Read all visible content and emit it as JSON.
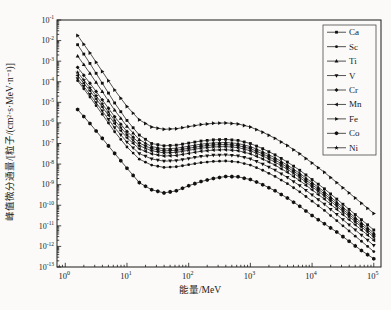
{
  "page": {
    "background": "#fbfaf8",
    "ink_color": "#1a1a1a"
  },
  "chart_data": {
    "type": "line",
    "title": "",
    "x_axis": {
      "label": "能量/MeV",
      "scale": "log",
      "tick_exponents": [
        0,
        1,
        2,
        3,
        4,
        5
      ],
      "range_log10": [
        -0.134,
        5.117
      ]
    },
    "y_axis": {
      "label": "峰值微分通量/[粒子/(cm²·s·MeV·n⁻¹)]",
      "scale": "log",
      "tick_exponents": [
        -1,
        -2,
        -3,
        -4,
        -5,
        -6,
        -7,
        -8,
        -9,
        -10,
        -11,
        -12,
        -13
      ],
      "range_log10": [
        -13.0,
        -1.0
      ]
    },
    "grid": false,
    "line_color": "#1b1b1b",
    "marker_color": "#101010",
    "log10_energy": [
      0.2,
      0.4,
      0.6,
      0.8,
      1.0,
      1.2,
      1.4,
      1.6,
      1.8,
      2.0,
      2.2,
      2.4,
      2.6,
      2.8,
      3.0,
      3.2,
      3.4,
      3.6,
      3.8,
      4.0,
      4.2,
      4.4,
      4.6,
      4.8,
      5.0
    ],
    "series": [
      {
        "name": "Ca",
        "marker": "square",
        "log10_flux": [
          -2.2,
          -3.11,
          -4.07,
          -5.03,
          -5.88,
          -6.59,
          -7.0,
          -7.11,
          -7.08,
          -6.98,
          -6.88,
          -6.82,
          -6.8,
          -6.85,
          -7.0,
          -7.25,
          -7.55,
          -7.9,
          -8.3,
          -8.75,
          -9.2,
          -9.7,
          -10.2,
          -10.7,
          -11.2
        ]
      },
      {
        "name": "Sc",
        "marker": "circle",
        "log10_flux": [
          -3.95,
          -4.74,
          -5.58,
          -6.43,
          -7.17,
          -7.76,
          -8.05,
          -8.16,
          -8.13,
          -8.03,
          -7.93,
          -7.87,
          -7.85,
          -7.9,
          -8.05,
          -8.3,
          -8.6,
          -8.95,
          -9.35,
          -9.8,
          -10.25,
          -10.75,
          -11.25,
          -11.75,
          -12.25
        ]
      },
      {
        "name": "Ti",
        "marker": "triangle-up",
        "log10_flux": [
          -2.75,
          -3.59,
          -4.48,
          -5.38,
          -6.17,
          -6.81,
          -7.15,
          -7.26,
          -7.23,
          -7.13,
          -7.03,
          -6.97,
          -6.95,
          -7.0,
          -7.15,
          -7.4,
          -7.7,
          -8.05,
          -8.45,
          -8.9,
          -9.35,
          -9.85,
          -10.35,
          -10.85,
          -11.35
        ]
      },
      {
        "name": "V",
        "marker": "triangle-down",
        "log10_flux": [
          -3.85,
          -4.61,
          -5.42,
          -6.23,
          -6.93,
          -7.49,
          -7.75,
          -7.86,
          -7.83,
          -7.73,
          -7.63,
          -7.57,
          -7.55,
          -7.6,
          -7.75,
          -8.0,
          -8.3,
          -8.65,
          -9.05,
          -9.5,
          -9.95,
          -10.45,
          -10.95,
          -11.45,
          -11.95
        ]
      },
      {
        "name": "Cr",
        "marker": "diamond",
        "log10_flux": [
          -3.3,
          -4.07,
          -4.88,
          -5.7,
          -6.42,
          -6.98,
          -7.25,
          -7.36,
          -7.33,
          -7.23,
          -7.13,
          -7.07,
          -7.05,
          -7.1,
          -7.25,
          -7.5,
          -7.8,
          -8.15,
          -8.55,
          -9.0,
          -9.45,
          -9.95,
          -10.45,
          -10.95,
          -11.45
        ]
      },
      {
        "name": "Mn",
        "marker": "triangle-left",
        "log10_flux": [
          -3.7,
          -4.44,
          -5.23,
          -6.03,
          -6.72,
          -7.26,
          -7.5,
          -7.61,
          -7.58,
          -7.48,
          -7.38,
          -7.32,
          -7.3,
          -7.35,
          -7.5,
          -7.75,
          -8.05,
          -8.4,
          -8.8,
          -9.25,
          -9.7,
          -10.2,
          -10.7,
          -11.2,
          -11.7
        ]
      },
      {
        "name": "Fe",
        "marker": "triangle-right",
        "log10_flux": [
          -1.75,
          -2.6,
          -3.5,
          -4.4,
          -5.2,
          -5.85,
          -6.2,
          -6.31,
          -6.28,
          -6.18,
          -6.08,
          -6.02,
          -6.0,
          -6.05,
          -6.2,
          -6.45,
          -6.75,
          -7.1,
          -7.5,
          -7.95,
          -8.4,
          -8.9,
          -9.4,
          -9.9,
          -10.4
        ]
      },
      {
        "name": "Co",
        "marker": "hexagon",
        "log10_flux": [
          -5.35,
          -6.03,
          -6.75,
          -7.48,
          -8.2,
          -8.9,
          -9.25,
          -9.4,
          -9.3,
          -9.05,
          -8.85,
          -8.7,
          -8.6,
          -8.62,
          -8.75,
          -9.0,
          -9.3,
          -9.65,
          -10.05,
          -10.5,
          -10.9,
          -11.3,
          -11.75,
          -12.2,
          -12.6
        ]
      },
      {
        "name": "Ni",
        "marker": "star",
        "log10_flux": [
          -3.55,
          -4.29,
          -5.08,
          -5.88,
          -6.57,
          -7.11,
          -7.35,
          -7.46,
          -7.43,
          -7.33,
          -7.23,
          -7.17,
          -7.15,
          -7.2,
          -7.35,
          -7.6,
          -7.9,
          -8.25,
          -8.65,
          -9.1,
          -9.55,
          -10.05,
          -10.55,
          -11.05,
          -11.55
        ]
      }
    ],
    "legend": {
      "position": "top-right",
      "entries": [
        "Ca",
        "Sc",
        "Ti",
        "V",
        "Cr",
        "Mn",
        "Fe",
        "Co",
        "Ni"
      ]
    }
  }
}
